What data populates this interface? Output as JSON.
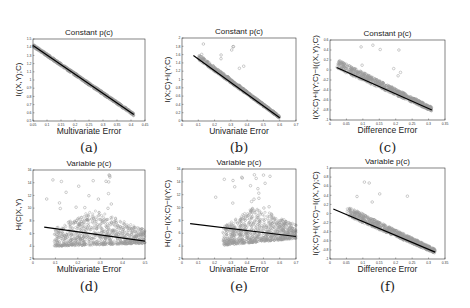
{
  "figure": {
    "panels": [
      {
        "id": "a",
        "sublabel": "(a)",
        "title": "Constant p(c)",
        "xlabel": "Multivariate Error",
        "ylabel": "I((X,Y);C)"
      },
      {
        "id": "b",
        "sublabel": "(b)",
        "title": "Constant p(c)",
        "xlabel": "Univariate Error",
        "ylabel": "I(X;C)+I(Y;C)"
      },
      {
        "id": "c",
        "sublabel": "(c)",
        "title": "Constant p(c)",
        "xlabel": "Difference Error",
        "ylabel": "I(X;C)+I(Y;C)−I((X,Y);C)"
      },
      {
        "id": "d",
        "sublabel": "(d)",
        "title": "Variable p(c)",
        "xlabel": "Multivariate Error",
        "ylabel": "H(C|X,Y)"
      },
      {
        "id": "e",
        "sublabel": "(e)",
        "title": "Variable p(c)",
        "xlabel": "Univariate Error",
        "ylabel": "H(C)−I(X;C)−I(Y;C)"
      },
      {
        "id": "f",
        "sublabel": "(f)",
        "title": "Variable p(c)",
        "xlabel": "Difference Error",
        "ylabel": "I(X;C)+I(Y;C)−I((X,Y);C)"
      }
    ]
  },
  "chart_data": [
    {
      "type": "scatter",
      "title": "Constant p(c)",
      "xlabel": "Multivariate Error",
      "ylabel": "I((X,Y);C)",
      "xlim": [
        0.05,
        0.45
      ],
      "ylim": [
        0.5,
        1.5
      ],
      "xticks": [
        0.05,
        0.1,
        0.15,
        0.2,
        0.25,
        0.3,
        0.35,
        0.4,
        0.45
      ],
      "yticks": [
        0.5,
        0.6,
        0.7,
        0.8,
        0.9,
        1,
        1.1,
        1.2,
        1.3,
        1.4,
        1.5
      ],
      "fit_line": {
        "x": [
          0.05,
          0.41
        ],
        "y": [
          1.42,
          0.58
        ]
      },
      "scatter": {
        "x_range": [
          0.05,
          0.41
        ],
        "spread": 0.035,
        "outliers": 0
      },
      "grid": false,
      "legend": null
    },
    {
      "type": "scatter",
      "title": "Constant p(c)",
      "xlabel": "Univariate Error",
      "ylabel": "I(X;C)+I(Y;C)",
      "xlim": [
        0,
        0.7
      ],
      "ylim": [
        0,
        2
      ],
      "xticks": [
        0,
        0.1,
        0.2,
        0.3,
        0.4,
        0.5,
        0.6,
        0.7
      ],
      "yticks": [
        0,
        0.2,
        0.4,
        0.6,
        0.8,
        1,
        1.2,
        1.4,
        1.6,
        1.8,
        2
      ],
      "fit_line": {
        "x": [
          0.07,
          0.6
        ],
        "y": [
          1.58,
          0.08
        ]
      },
      "scatter": {
        "x_range": [
          0.1,
          0.6
        ],
        "spread": 0.12,
        "outliers": 10
      },
      "grid": false,
      "legend": null
    },
    {
      "type": "scatter",
      "title": "Constant p(c)",
      "xlabel": "Difference Error",
      "ylabel": "I(X;C)+I(Y;C)−I((X,Y);C)",
      "xlim": [
        0,
        0.35
      ],
      "ylim": [
        -1,
        0.6
      ],
      "xticks": [
        0,
        0.05,
        0.1,
        0.15,
        0.2,
        0.25,
        0.3,
        0.35
      ],
      "yticks": [
        -1,
        -0.8,
        -0.6,
        -0.4,
        -0.2,
        0,
        0.2,
        0.4,
        0.6
      ],
      "fit_line": {
        "x": [
          0.02,
          0.31
        ],
        "y": [
          0.05,
          -0.8
        ]
      },
      "scatter": {
        "x_range": [
          0.02,
          0.31
        ],
        "spread": 0.18,
        "outliers": 8
      },
      "grid": false,
      "legend": null
    },
    {
      "type": "scatter",
      "title": "Variable p(c)",
      "xlabel": "Multivariate Error",
      "ylabel": "H(C|X,Y)",
      "xlim": [
        0,
        0.5
      ],
      "ylim": [
        2,
        16
      ],
      "xticks": [
        0,
        0.1,
        0.2,
        0.3,
        0.4,
        0.5
      ],
      "yticks": [
        2,
        4,
        6,
        8,
        10,
        12,
        14,
        16
      ],
      "fit_line": {
        "x": [
          0.05,
          0.5
        ],
        "y": [
          7.0,
          4.8
        ]
      },
      "scatter": {
        "x_range": [
          0.05,
          0.5
        ],
        "spread": 3.5,
        "outliers": 20
      },
      "grid": false,
      "legend": null
    },
    {
      "type": "scatter",
      "title": "Variable p(c)",
      "xlabel": "Univariate Error",
      "ylabel": "H(C)−I(X;C)−I(Y;C)",
      "xlim": [
        0,
        0.7
      ],
      "ylim": [
        2,
        16
      ],
      "xticks": [
        0,
        0.1,
        0.2,
        0.3,
        0.4,
        0.5,
        0.6,
        0.7
      ],
      "yticks": [
        2,
        4,
        6,
        8,
        10,
        12,
        14,
        16
      ],
      "fit_line": {
        "x": [
          0.05,
          0.7
        ],
        "y": [
          7.5,
          5.5
        ]
      },
      "scatter": {
        "x_range": [
          0.2,
          0.7
        ],
        "spread": 3.5,
        "outliers": 20
      },
      "grid": false,
      "legend": null
    },
    {
      "type": "scatter",
      "title": "Variable p(c)",
      "xlabel": "Difference Error",
      "ylabel": "I(X;C)+I(Y;C)−I((X,Y);C)",
      "xlim": [
        0,
        0.35
      ],
      "ylim": [
        -1,
        1
      ],
      "xticks": [
        0,
        0.05,
        0.1,
        0.15,
        0.2,
        0.25,
        0.3,
        0.35
      ],
      "yticks": [
        -1,
        -0.8,
        -0.6,
        -0.4,
        -0.2,
        0,
        0.2,
        0.4,
        0.6,
        0.8,
        1
      ],
      "fit_line": {
        "x": [
          0.01,
          0.32
        ],
        "y": [
          0.1,
          -0.85
        ]
      },
      "scatter": {
        "x_range": [
          0.05,
          0.32
        ],
        "spread": 0.2,
        "outliers": 6
      },
      "grid": false,
      "legend": null
    }
  ],
  "layout": {
    "frames": [
      {
        "left": 33,
        "top": 39,
        "width": 112,
        "height": 82
      },
      {
        "left": 182,
        "top": 38,
        "width": 114,
        "height": 83
      },
      {
        "left": 330,
        "top": 40,
        "width": 115,
        "height": 80
      },
      {
        "left": 33,
        "top": 170,
        "width": 112,
        "height": 89
      },
      {
        "left": 182,
        "top": 169,
        "width": 114,
        "height": 90
      },
      {
        "left": 330,
        "top": 168,
        "width": 115,
        "height": 91
      }
    ],
    "sublabel_y": [
      140,
      140,
      140,
      279,
      279,
      279
    ],
    "colors": {
      "points": "#9a9a9a",
      "line": "#000000",
      "axes": "#333333"
    }
  }
}
